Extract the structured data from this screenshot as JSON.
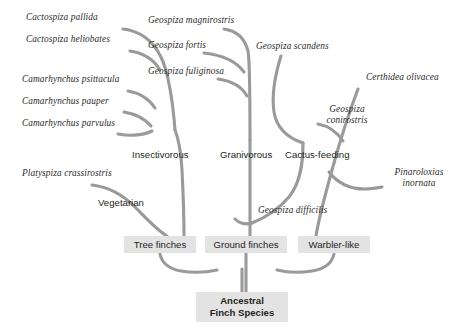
{
  "diagram": {
    "branch_color": "#9a9a9a",
    "box_fill": "#e3e3e3",
    "text_color": "#231f20",
    "background": "#ffffff"
  },
  "species": [
    {
      "id": "cactospiza-pallida",
      "name": "Cactospiza pallida",
      "x": 26,
      "y": 12
    },
    {
      "id": "cactospiza-heliobates",
      "name": "Cactospiza heliobates",
      "x": 26,
      "y": 39
    },
    {
      "id": "camarhynchus-psittacula",
      "name": "Camarhynchus psittacula",
      "x": 22,
      "y": 78
    },
    {
      "id": "camarhynchus-pauper",
      "name": "Camarhynchus pauper",
      "x": 22,
      "y": 101
    },
    {
      "id": "camarhynchus-parvulus",
      "name": "Camarhynchus parvulus",
      "x": 22,
      "y": 123
    },
    {
      "id": "geospiza-magnirostris",
      "name": "Geospiza magnirostris",
      "x": 148,
      "y": 20
    },
    {
      "id": "geospiza-fortis",
      "name": "Geospiza fortis",
      "x": 148,
      "y": 45
    },
    {
      "id": "geospiza-fuliginosa",
      "name": "Geospiza fuliginosa",
      "x": 148,
      "y": 71
    },
    {
      "id": "geospiza-scandens",
      "name": "Geospiza scandens",
      "x": 256,
      "y": 44
    },
    {
      "id": "certhidea-olivacea",
      "name": "Certhidea olivacea",
      "x": 366,
      "y": 75
    },
    {
      "id": "platyspiza-crassirostris",
      "name": "Platyspiza crassirostris",
      "x": 22,
      "y": 172
    },
    {
      "id": "geospiza-difficilis",
      "name": "Geospiza difficilis",
      "x": 258,
      "y": 207
    }
  ],
  "species_two_line": [
    {
      "id": "geospiza-conirostris",
      "line1": "Geospiza",
      "line2": "conirostris",
      "x": 316,
      "y": 107,
      "width": 62
    },
    {
      "id": "pinaroloxias-inornata",
      "line1": "Pinaroloxias",
      "line2": "inornata",
      "x": 386,
      "y": 170,
      "width": 66
    }
  ],
  "groups": [
    {
      "id": "insectivorous",
      "name": "Insectivorous",
      "x": 132,
      "y": 152
    },
    {
      "id": "granivorous",
      "name": "Granivorous",
      "x": 220,
      "y": 152
    },
    {
      "id": "cactus-feeding",
      "name": "Cactus-feeding",
      "x": 286,
      "y": 152
    },
    {
      "id": "vegetarian",
      "name": "Vegetarian",
      "x": 98,
      "y": 200
    }
  ],
  "clade_boxes": [
    {
      "id": "tree-finches",
      "label": "Tree finches",
      "x": 124,
      "y": 236,
      "w": 72,
      "h": 17
    },
    {
      "id": "ground-finches",
      "label": "Ground finches",
      "x": 205,
      "y": 236,
      "w": 82,
      "h": 17
    },
    {
      "id": "warbler-like",
      "label": "Warbler-like",
      "x": 298,
      "y": 236,
      "w": 72,
      "h": 17
    }
  ],
  "root_box": {
    "id": "ancestral-finch-species",
    "line1": "Ancestral",
    "line2": "Finch Species",
    "x": 196,
    "y": 292,
    "w": 92,
    "h": 30
  },
  "branches": {
    "insectivorous_trunk": "M186,236 C186,210 185,185 184,162 C183,145 180,135 175,128",
    "tips": [
      "M123,30 C140,32 152,42 160,58 C167,72 172,100 175,128",
      "M128,52 C142,54 152,62 158,72",
      "M126,92 C138,94 147,100 153,108",
      "M123,111 C134,113 142,118 148,124",
      "M120,132 C130,133 138,134 148,130",
      "M225,30 C238,32 245,40 248,52 C250,62 250,100 250,140",
      "M205,54 C222,56 235,62 243,72",
      "M219,80 C232,82 241,88 246,96"
    ],
    "granivorous_trunk": "M250,140 L250,236",
    "cactus": [
      "M281,56 C276,70 272,90 274,110 C276,128 290,138 304,142",
      "M318,124 C330,126 338,132 344,140",
      "M304,142 C304,160 302,180 290,196 C278,210 262,218 252,222"
    ],
    "difficilis": "M252,222 C244,224 238,222 234,218",
    "warbler": [
      "M358,90 C350,110 340,140 332,170 C324,200 318,222 316,236",
      "M381,188 C370,190 358,192 344,186 C336,182 332,176 330,172"
    ],
    "vegetarian": [
      "M92,186 C108,188 122,196 134,208 C146,220 156,230 166,236"
    ],
    "bottom_join": [
      "M160,253 C162,262 168,268 180,270 C192,272 206,272 216,270",
      "M246,253 L246,292",
      "M334,253 C332,262 326,268 312,270 C298,272 284,272 276,270"
    ],
    "root_trunk": "M242,270 L242,292"
  }
}
